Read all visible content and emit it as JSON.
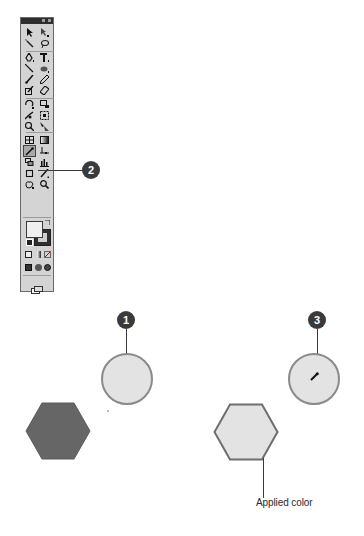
{
  "toolbar": {
    "title": "Tools",
    "rows": [
      [
        "selection-tool",
        "direct-selection-tool"
      ],
      [
        "magic-wand-tool",
        "lasso-tool"
      ],
      [
        "pen-tool",
        "type-tool"
      ],
      [
        "line-segment-tool",
        "ellipse-tool"
      ],
      [
        "paintbrush-tool",
        "pencil-tool"
      ],
      [
        "blob-brush-tool",
        "eraser-tool"
      ],
      [
        "rotate-tool",
        "scale-tool"
      ],
      [
        "warp-tool",
        "free-transform-tool"
      ],
      [
        "symbol-sprayer-tool",
        "column-graph-tool"
      ],
      [
        "mesh-tool",
        "gradient-tool"
      ],
      [
        "eyedropper-tool",
        "live-paint-bucket-tool"
      ],
      [
        "slice-tool",
        "graph-tool"
      ],
      [
        "artboard-tool",
        "knife-tool"
      ],
      [
        "hand-tool",
        "zoom-tool"
      ]
    ],
    "active_tool": "eyedropper-tool",
    "fill_color": "#efefef",
    "stroke_color": "#2e2e2e",
    "color_modes": [
      "color",
      "gradient",
      "none"
    ],
    "draw_modes": [
      "draw-normal",
      "draw-behind",
      "draw-inside"
    ],
    "screen_mode": "change-screen-mode"
  },
  "callouts": [
    {
      "number": "1",
      "target": "source-circle"
    },
    {
      "number": "2",
      "target": "eyedropper-tool"
    },
    {
      "number": "3",
      "target": "eyedropper-cursor"
    }
  ],
  "shapes": {
    "source_circle_color": "#e3e3e3",
    "original_hexagon_color": "#666666",
    "applied_hexagon_color": "#e3e3e3",
    "stroke_color": "#8a8a8a"
  },
  "labels": {
    "applied_color": "Applied color"
  }
}
